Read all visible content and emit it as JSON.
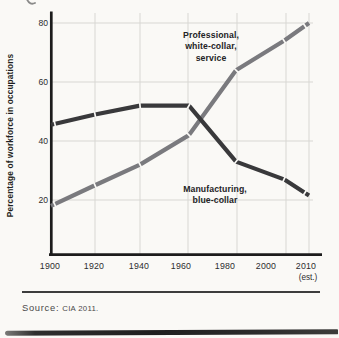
{
  "figure": {
    "source_label": "Source:",
    "source_citation": "CIA 2011."
  },
  "chart_data": {
    "type": "line",
    "title": "",
    "xlabel": "",
    "ylabel": "Percentage of workforce in occupations",
    "categories": [
      1900,
      1920,
      1940,
      1960,
      1980,
      2000,
      2010
    ],
    "x_tick_labels": [
      "1900",
      "1920",
      "1940",
      "1960",
      "1980",
      "2000",
      "2010"
    ],
    "x_tick_note": "(est.)",
    "y_tick_labels": [
      "80",
      "60",
      "40",
      "20"
    ],
    "y_gridlines": [
      20,
      40,
      60,
      80
    ],
    "ylim": [
      0,
      85
    ],
    "grid": true,
    "legend_position": "inline annotations on lines",
    "series": [
      {
        "name": "Professional, white-collar, service",
        "label_lines": [
          "Professional,",
          "white-collar,",
          "service"
        ],
        "color": "#7a7a7e",
        "values": [
          18,
          25,
          32,
          42,
          64,
          74,
          80
        ]
      },
      {
        "name": "Manufacturing, blue-collar",
        "label_lines": [
          "Manufacturing,",
          "blue-collar"
        ],
        "color": "#39393b",
        "values": [
          45.5,
          49,
          52,
          52,
          33,
          27,
          21.5
        ]
      }
    ]
  }
}
